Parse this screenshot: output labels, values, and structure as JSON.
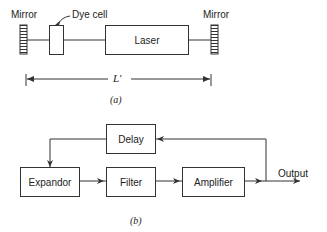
{
  "figure_a": {
    "mirror_left": "Mirror",
    "mirror_right": "Mirror",
    "dye_cell": "Dye cell",
    "laser": "Laser",
    "length_label": "L′",
    "caption": "(a)"
  },
  "figure_b": {
    "delay": "Delay",
    "expandor": "Expandor",
    "filter": "Filter",
    "amplifier": "Amplifier",
    "output": "Output",
    "caption": "(b)"
  }
}
